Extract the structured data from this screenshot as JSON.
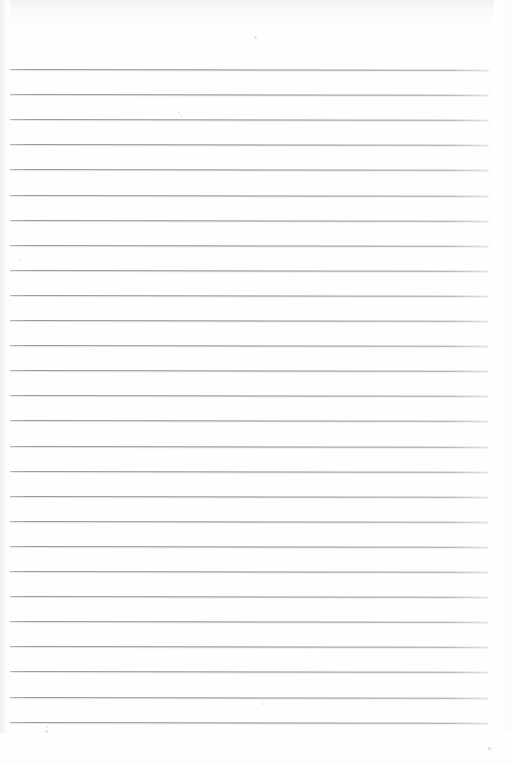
{
  "document": {
    "kind": "scanned-lined-paper",
    "title": "Blank Ruled Notebook Page",
    "orientation": "portrait",
    "page_width_px": 512,
    "page_height_px": 763,
    "background_color": "#fefefe",
    "paper_color": "#ffffff",
    "text_content": "",
    "has_handwriting": false,
    "has_printed_text": false
  },
  "ruling": {
    "style": "wide-ruled horizontal lines",
    "line_color": "#7c7e86",
    "line_thickness_px": 1,
    "line_count": 27,
    "first_line_y": 69,
    "line_spacing_px": 25.1,
    "line_start_x": 2,
    "line_end_x": 489,
    "margin_line_present": false,
    "header_blank_height_px": 69,
    "footer_blank_height_px": 41,
    "skew_degrees": 0.085,
    "line_y_positions": [
      69,
      94.1,
      119.2,
      144.3,
      169.4,
      194.5,
      219.6,
      244.7,
      269.8,
      294.9,
      320.0,
      345.1,
      370.2,
      395.3,
      420.4,
      445.5,
      470.6,
      495.7,
      520.8,
      545.9,
      571.0,
      596.1,
      621.2,
      646.3,
      671.4,
      696.5,
      721.6
    ]
  },
  "artifacts": {
    "label": "scan dust specks",
    "specks": [
      {
        "x": 254,
        "y": 36,
        "size": 3,
        "color": "rgba(205,207,212,0.55)"
      },
      {
        "x": 178,
        "y": 112,
        "size": 2,
        "color": "rgba(210,212,216,0.50)"
      },
      {
        "x": 181,
        "y": 115,
        "size": 2,
        "color": "rgba(214,216,220,0.45)"
      },
      {
        "x": 18,
        "y": 259,
        "size": 2,
        "color": "rgba(208,210,215,0.48)"
      },
      {
        "x": 262,
        "y": 703,
        "size": 2,
        "color": "rgba(206,208,213,0.50)"
      },
      {
        "x": 45,
        "y": 730,
        "size": 3,
        "color": "rgba(202,204,210,0.55)"
      },
      {
        "x": 488,
        "y": 747,
        "size": 3,
        "color": "rgba(198,200,206,0.60)"
      },
      {
        "x": 46,
        "y": 726,
        "size": 2,
        "color": "rgba(212,214,218,0.45)"
      }
    ]
  },
  "shading": {
    "top_edge": "#f2f2f3",
    "left_edge": "#f0f0f1",
    "right_edge": "#fbfbfc",
    "bottom_edge": "#fcfcfd"
  }
}
